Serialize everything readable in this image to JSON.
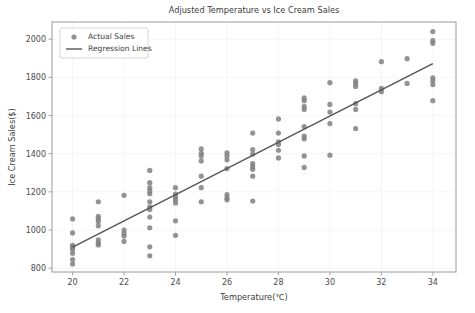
{
  "chart_data": {
    "type": "scatter",
    "title": "Adjusted Temperature vs Ice Cream Sales",
    "xlabel": "Temperature(℃)",
    "ylabel": "Ice Cream Sales($)",
    "xlim": [
      19.2,
      34.9
    ],
    "ylim": [
      780,
      2090
    ],
    "xticks": [
      20,
      22,
      24,
      26,
      28,
      30,
      32,
      34
    ],
    "yticks": [
      800,
      1000,
      1200,
      1400,
      1600,
      1800,
      2000
    ],
    "grid": true,
    "legend_position": "upper left",
    "legend": [
      {
        "label": "Actual Sales",
        "marker": "dot",
        "color": "#808080"
      },
      {
        "label": "Regression Lines",
        "marker": "line",
        "color": "#555555"
      }
    ],
    "series": [
      {
        "name": "Actual Sales",
        "type": "scatter",
        "color": "#808080",
        "marker_size": 4,
        "points": [
          [
            20,
            1058
          ],
          [
            20,
            985
          ],
          [
            20,
            920
          ],
          [
            20,
            910
          ],
          [
            20,
            898
          ],
          [
            20,
            878
          ],
          [
            20,
            845
          ],
          [
            20,
            822
          ],
          [
            21,
            1148
          ],
          [
            21,
            1072
          ],
          [
            21,
            1058
          ],
          [
            21,
            1044
          ],
          [
            21,
            1022
          ],
          [
            21,
            948
          ],
          [
            21,
            932
          ],
          [
            21,
            922
          ],
          [
            22,
            1182
          ],
          [
            22,
            1000
          ],
          [
            22,
            982
          ],
          [
            22,
            968
          ],
          [
            22,
            940
          ],
          [
            23,
            1312
          ],
          [
            23,
            1248
          ],
          [
            23,
            1222
          ],
          [
            23,
            1205
          ],
          [
            23,
            1190
          ],
          [
            23,
            1148
          ],
          [
            23,
            1122
          ],
          [
            23,
            1108
          ],
          [
            23,
            1068
          ],
          [
            23,
            1012
          ],
          [
            23,
            912
          ],
          [
            23,
            865
          ],
          [
            24,
            1222
          ],
          [
            24,
            1188
          ],
          [
            24,
            1172
          ],
          [
            24,
            1158
          ],
          [
            24,
            1142
          ],
          [
            24,
            1048
          ],
          [
            24,
            972
          ],
          [
            25,
            1425
          ],
          [
            25,
            1402
          ],
          [
            25,
            1388
          ],
          [
            25,
            1362
          ],
          [
            25,
            1282
          ],
          [
            25,
            1222
          ],
          [
            25,
            1148
          ],
          [
            26,
            1405
          ],
          [
            26,
            1388
          ],
          [
            26,
            1368
          ],
          [
            26,
            1322
          ],
          [
            26,
            1185
          ],
          [
            26,
            1168
          ],
          [
            26,
            1158
          ],
          [
            27,
            1508
          ],
          [
            27,
            1422
          ],
          [
            27,
            1398
          ],
          [
            27,
            1348
          ],
          [
            27,
            1332
          ],
          [
            27,
            1318
          ],
          [
            27,
            1282
          ],
          [
            27,
            1152
          ],
          [
            28,
            1582
          ],
          [
            28,
            1508
          ],
          [
            28,
            1462
          ],
          [
            28,
            1448
          ],
          [
            28,
            1418
          ],
          [
            28,
            1378
          ],
          [
            29,
            1692
          ],
          [
            29,
            1678
          ],
          [
            29,
            1648
          ],
          [
            29,
            1632
          ],
          [
            29,
            1542
          ],
          [
            29,
            1492
          ],
          [
            29,
            1478
          ],
          [
            29,
            1388
          ],
          [
            29,
            1328
          ],
          [
            30,
            1772
          ],
          [
            30,
            1658
          ],
          [
            30,
            1618
          ],
          [
            30,
            1558
          ],
          [
            30,
            1392
          ],
          [
            31,
            1782
          ],
          [
            31,
            1768
          ],
          [
            31,
            1752
          ],
          [
            31,
            1662
          ],
          [
            31,
            1632
          ],
          [
            31,
            1532
          ],
          [
            32,
            1882
          ],
          [
            32,
            1742
          ],
          [
            32,
            1725
          ],
          [
            33,
            1898
          ],
          [
            33,
            1768
          ],
          [
            34,
            2040
          ],
          [
            34,
            1992
          ],
          [
            34,
            1978
          ],
          [
            34,
            1798
          ],
          [
            34,
            1782
          ],
          [
            34,
            1762
          ],
          [
            34,
            1678
          ]
        ]
      },
      {
        "name": "Regression Lines",
        "type": "line",
        "color": "#555555",
        "line_width": 1.4,
        "points": [
          [
            20,
            910
          ],
          [
            34,
            1872
          ]
        ]
      }
    ]
  }
}
